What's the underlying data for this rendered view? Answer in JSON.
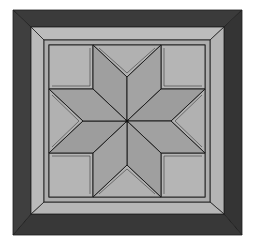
{
  "image": {
    "subject": "LeMoyne star quilt block",
    "description": "Eight-pointed star quilt block with corner squares, setting triangles, and a mitered border",
    "width": 253,
    "height": 243
  },
  "colors": {
    "background": "#ffffff",
    "outer_border": "#3b3b3b",
    "outer_border_shadow": "#2e2e2e",
    "inner_border": "#b9b9b9",
    "inner_border_shadow": "#a9a9a9",
    "narrow_band": "#aaaaaa",
    "field": "#b3b3b3",
    "star_diamond": "#9e9e9e",
    "star_diamond_alt": "#a5a5a5",
    "line": "#1e1e1e"
  },
  "geometry": {
    "outer": [
      13,
      10,
      242,
      235
    ],
    "dark_inner": [
      31,
      27,
      224,
      214
    ],
    "light_inner": [
      44,
      40,
      210,
      202
    ],
    "field": [
      49,
      45,
      205,
      197
    ],
    "center": [
      127,
      121
    ],
    "corner_size": 44,
    "notches": {
      "top": [
        127,
        77
      ],
      "bottom": [
        127,
        165
      ],
      "left": [
        83,
        121
      ],
      "right": [
        171,
        121
      ]
    }
  }
}
